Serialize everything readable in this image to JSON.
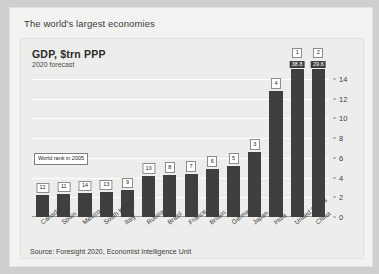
{
  "card": {
    "headline": "The world's largest economies"
  },
  "chart_data": {
    "type": "bar",
    "title": "GDP, $trn PPP",
    "subtitle": "2020 forecast",
    "xlabel": "",
    "ylabel": "",
    "ylim": [
      0,
      15
    ],
    "yticks": [
      0,
      2,
      4,
      6,
      8,
      10,
      12,
      14
    ],
    "grid": true,
    "legend_position": "inside-left",
    "legend_note": "World rank in 2005",
    "source": "Source: Foresight 2020, Economist Intelligence Unit",
    "categories": [
      "Canada",
      "Spain",
      "Mexico",
      "South Korea",
      "Italy",
      "Russia",
      "Brazil",
      "France",
      "Britain",
      "Germany",
      "Japan",
      "India",
      "United States",
      "China"
    ],
    "values": [
      2.2,
      2.3,
      2.4,
      2.5,
      2.7,
      4.2,
      4.3,
      4.4,
      4.9,
      5.2,
      6.6,
      12.8,
      15.0,
      15.0
    ],
    "rank_2005": [
      "12",
      "11",
      "14",
      "13",
      "9",
      "10",
      "8",
      "7",
      "6",
      "5",
      "3",
      "4",
      "1",
      "2"
    ],
    "value_labels": [
      "",
      "",
      "",
      "",
      "",
      "",
      "",
      "",
      "",
      "",
      "",
      "",
      "38.8",
      "29.6"
    ],
    "truncated": [
      false,
      false,
      false,
      false,
      false,
      false,
      false,
      false,
      false,
      false,
      false,
      false,
      true,
      true
    ],
    "bar_color": "#3f3f3f",
    "panel_color": "#ededeb",
    "gridline_color": "#ffffff"
  }
}
